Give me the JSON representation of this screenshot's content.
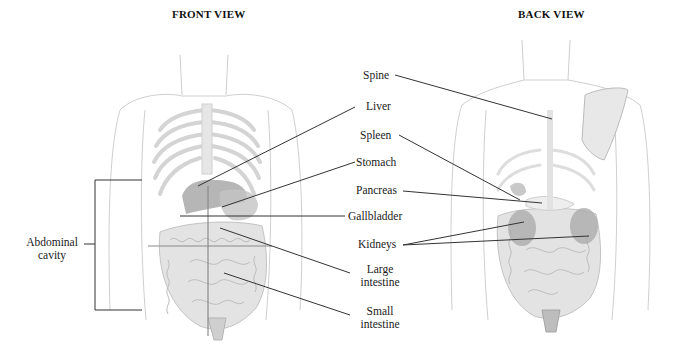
{
  "front": {
    "title": "FRONT VIEW",
    "labels": {
      "liver": "Liver",
      "stomach": "Stomach",
      "gallbladder": "Gallbladder",
      "large_intestine_1": "Large",
      "large_intestine_2": "intestine",
      "small_intestine_1": "Small",
      "small_intestine_2": "intestine",
      "abdominal_1": "Abdominal",
      "abdominal_2": "cavity"
    }
  },
  "back": {
    "title": "BACK VIEW",
    "labels": {
      "spine": "Spine",
      "spleen": "Spleen",
      "pancreas": "Pancreas",
      "kidneys": "Kidneys"
    }
  },
  "colors": {
    "leader_line": "#333333",
    "organ_shade": "#9a9a9a",
    "body_outline": "#c8c8c8",
    "organ_light": "#dcdcdc"
  }
}
